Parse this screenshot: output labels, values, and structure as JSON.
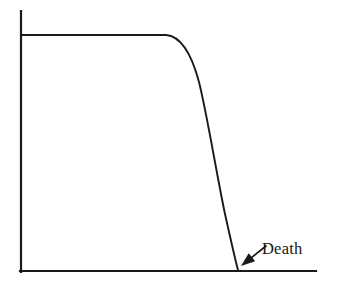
{
  "figure": {
    "background_color": "#ffffff",
    "ink_color": "#1a1a1a",
    "width": 341,
    "height": 287
  },
  "annotations": [
    {
      "id": "death-label",
      "label": "Death",
      "icon": "arrow-down-left-icon",
      "text_x": 262,
      "text_y": 254,
      "arrow_from_x": 266,
      "arrow_from_y": 246,
      "arrow_to_x": 241,
      "arrow_to_y": 266
    }
  ],
  "chart_data": {
    "type": "line",
    "title": "",
    "subtitle": "",
    "xlabel": "",
    "ylabel": "",
    "xlim": [
      0,
      100
    ],
    "ylim": [
      0,
      100
    ],
    "grid": false,
    "legend": "none",
    "axis_tick_labels": {
      "x": [],
      "y": []
    },
    "series": [
      {
        "name": "Survivorship",
        "style": "solid",
        "color": "#1a1a1a",
        "x": [
          0,
          20,
          40,
          50,
          55,
          58,
          60,
          63,
          66,
          69,
          72,
          75,
          78,
          81,
          84,
          87,
          90,
          93,
          96,
          100
        ],
        "y": [
          100,
          100,
          100,
          100,
          99,
          97,
          94,
          89,
          83,
          76,
          69,
          62,
          54,
          46,
          38,
          29,
          21,
          13,
          6,
          0
        ],
        "annotations": [
          "plateau until x=50",
          "steep convex decline",
          "reaches zero at x=100"
        ]
      }
    ]
  },
  "geometry": {
    "y_axis": {
      "x": 21,
      "y_top": 11,
      "y_bottom": 272
    },
    "x_axis": {
      "y": 271,
      "x_left": 20,
      "x_right": 316
    },
    "curve_path": "M 21 35 L 166 35 C 180 36 191 52 199 82 C 207 114 216 171 225 214 C 231 241 235 259 238 270",
    "plateau_y": 35,
    "plateau_start_x": 21,
    "plateau_end_x": 166,
    "terminus_x": 238,
    "terminus_y": 270
  }
}
